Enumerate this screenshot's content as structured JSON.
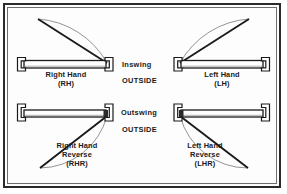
{
  "diagram": {
    "colors": {
      "frame": "#2b2b2b",
      "inner_rule": "#6f6f6f",
      "line": "#1a1a1a",
      "arc": "#555555",
      "panel_fill": "#ffffff",
      "jamb_fill": "#ffffff",
      "background": "#fdfdfd"
    },
    "center_labels": [
      {
        "name": "inswing",
        "swing": "Inswing",
        "side": "OUTSIDE"
      },
      {
        "name": "outswing",
        "swing": "Outswing",
        "side": "OUTSIDE"
      }
    ],
    "quadrants": [
      {
        "id": "right-hand",
        "position": "top-left",
        "lines": [
          "Right Hand",
          "(RH)"
        ],
        "abbreviation": "RH",
        "swing": "Inswing",
        "hinge": "right",
        "arc_direction": "up"
      },
      {
        "id": "left-hand",
        "position": "top-right",
        "lines": [
          "Left Hand",
          "(LH)"
        ],
        "abbreviation": "LH",
        "swing": "Inswing",
        "hinge": "left",
        "arc_direction": "up"
      },
      {
        "id": "right-hand-reverse",
        "position": "bottom-left",
        "lines": [
          "Right Hand",
          "Reverse",
          "(RHR)"
        ],
        "abbreviation": "RHR",
        "swing": "Outswing",
        "hinge": "right",
        "arc_direction": "down"
      },
      {
        "id": "left-hand-reverse",
        "position": "bottom-right",
        "lines": [
          "Left Hand",
          "Reverse",
          "(LHR)"
        ],
        "abbreviation": "LHR",
        "swing": "Outswing",
        "hinge": "left",
        "arc_direction": "down"
      }
    ]
  }
}
